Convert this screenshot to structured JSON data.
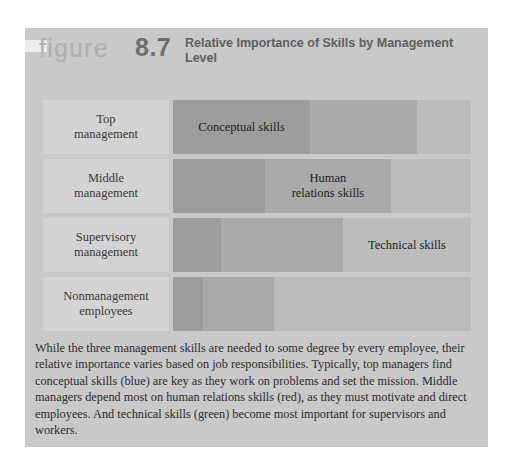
{
  "figure": {
    "word": "figure",
    "number": "8.7",
    "title": "Relative Importance of Skills by Management Level"
  },
  "caption": "While the three management skills are needed to some degree by every employee, their relative importance varies based on job responsibilities.  Typically, top managers find conceptual skills (blue) are key as they work on problems and set the mission. Middle managers depend most on human relations skills (red), as they must motivate and direct employees.  And technical skills (green) become most important for supervisors and workers.",
  "colors": {
    "panel_background": "#c9c9c9",
    "label_cell": "#d3d3d3",
    "conceptual_skills": "#9d9d9d",
    "human_relations_skills": "#aaaaaa",
    "technical_skills": "#bcbcbc",
    "title_text": "#5f5f5f",
    "figure_word": "#b0b0b0",
    "figure_number": "#6d6d6d"
  },
  "chart_data": {
    "type": "bar",
    "title": "Relative Importance of Skills by Management Level",
    "xlabel": "",
    "ylabel": "",
    "grid": false,
    "legend_position": "none",
    "stacked": true,
    "orientation": "horizontal",
    "xlim": [
      0,
      100
    ],
    "categories": [
      "Top management",
      "Middle management",
      "Supervisory management",
      "Nonmanagement employees"
    ],
    "series": [
      {
        "name": "Conceptual skills",
        "color": "#9d9d9d",
        "values": [
          46,
          31,
          16,
          10
        ]
      },
      {
        "name": "Human relations skills",
        "color": "#aaaaaa",
        "values": [
          36,
          42,
          41,
          24
        ]
      },
      {
        "name": "Technical skills",
        "color": "#bcbcbc",
        "values": [
          18,
          27,
          43,
          66
        ]
      }
    ],
    "segment_labels": [
      {
        "row": 0,
        "series": "Conceptual skills",
        "text": "Conceptual skills"
      },
      {
        "row": 1,
        "series": "Human relations skills",
        "text": "Human relations skills"
      },
      {
        "row": 2,
        "series": "Technical skills",
        "text": "Technical skills"
      }
    ]
  },
  "rows": [
    {
      "label": "Top\nmanagement",
      "label_line1": "Top",
      "label_line2": "management",
      "segments": [
        {
          "name": "conceptual",
          "text": "Conceptual skills",
          "width_pct": 46
        },
        {
          "name": "human-relations",
          "text": "",
          "width_pct": 36
        },
        {
          "name": "technical",
          "text": "",
          "width_pct": 18
        }
      ]
    },
    {
      "label": "Middle\nmanagement",
      "label_line1": "Middle",
      "label_line2": "management",
      "segments": [
        {
          "name": "conceptual",
          "text": "",
          "width_pct": 31
        },
        {
          "name": "human-relations",
          "text": "Human relations skills",
          "width_pct": 42
        },
        {
          "name": "technical",
          "text": "",
          "width_pct": 27
        }
      ]
    },
    {
      "label": "Supervisory\nmanagement",
      "label_line1": "Supervisory",
      "label_line2": "management",
      "segments": [
        {
          "name": "conceptual",
          "text": "",
          "width_pct": 16
        },
        {
          "name": "human-relations",
          "text": "",
          "width_pct": 41
        },
        {
          "name": "technical",
          "text": "Technical skills",
          "width_pct": 43
        }
      ]
    },
    {
      "label": "Nonmanagement\nemployees",
      "label_line1": "Nonmanagement",
      "label_line2": "employees",
      "segments": [
        {
          "name": "conceptual",
          "text": "",
          "width_pct": 10
        },
        {
          "name": "human-relations",
          "text": "",
          "width_pct": 24
        },
        {
          "name": "technical",
          "text": "",
          "width_pct": 66
        }
      ]
    }
  ]
}
